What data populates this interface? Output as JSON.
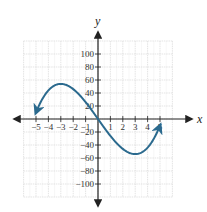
{
  "chart_data": {
    "type": "line",
    "title": "",
    "xlabel": "x",
    "ylabel": "y",
    "xlim": [
      -6,
      6
    ],
    "ylim": [
      -120,
      120
    ],
    "grid": true,
    "x_ticks": [
      -5,
      -4,
      -3,
      -2,
      -1,
      1,
      2,
      3,
      4,
      5
    ],
    "x_tick_labels": [
      "−5",
      "−4",
      "−3",
      "−2",
      "−1",
      "1",
      "2",
      "3",
      "4",
      "5"
    ],
    "y_ticks": [
      100,
      80,
      60,
      40,
      20,
      -20,
      -40,
      -60,
      -80,
      -100
    ],
    "y_tick_labels": [
      "100",
      "80",
      "60",
      "40",
      "20",
      "−20",
      "−40",
      "−60",
      "−80",
      "−100"
    ],
    "series": [
      {
        "name": "f(x)",
        "function_hint": "x^3 - 27x",
        "x": [
          -5,
          -4.5,
          -4,
          -3.5,
          -3,
          -2.5,
          -2,
          -1.5,
          -1,
          -0.5,
          0,
          0.5,
          1,
          1.5,
          2,
          2.5,
          3,
          3.5,
          4,
          4.5,
          5
        ],
        "y": [
          10,
          30.4,
          44,
          51.6,
          54,
          51.9,
          46,
          37.1,
          26,
          13.4,
          0,
          -13.4,
          -26,
          -37.1,
          -46,
          -51.9,
          -54,
          -51.6,
          -44,
          -30.4,
          -10
        ],
        "end_arrows": true,
        "color": "#2b6a8e"
      }
    ],
    "colors": {
      "curve": "#2b6a8e",
      "axis": "#222222",
      "grid": "#d9d9d9"
    }
  }
}
